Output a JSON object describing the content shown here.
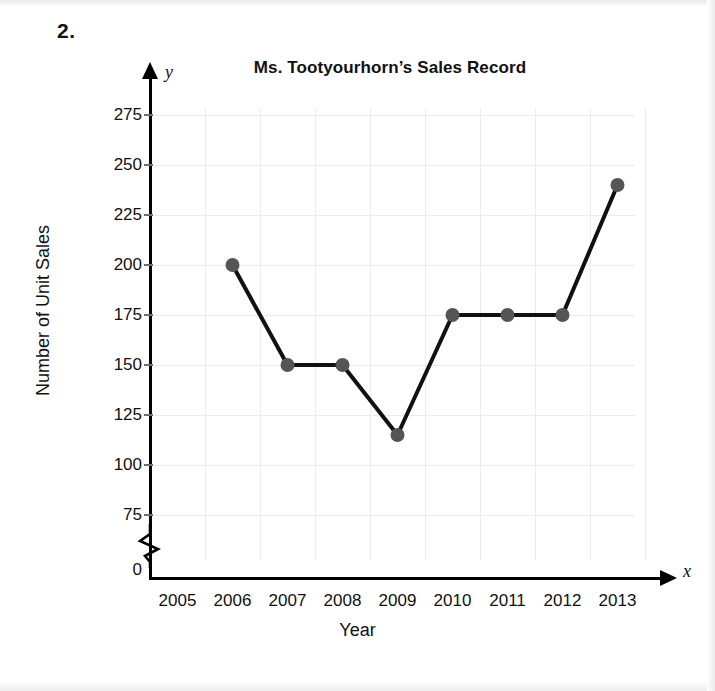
{
  "worksheet": {
    "problem_number": "2."
  },
  "chart_data": {
    "type": "line",
    "title": "Ms. Tootyourhorn’s Sales Record",
    "xlabel": "Year",
    "ylabel": "Number of Unit Sales",
    "x_axis_letter": "x",
    "y_axis_letter": "y",
    "categories": [
      "2005",
      "2006",
      "2007",
      "2008",
      "2009",
      "2010",
      "2011",
      "2012",
      "2013"
    ],
    "x_tick_labels": [
      "2005",
      "2006",
      "2007",
      "2008",
      "2009",
      "2010",
      "2011",
      "2012",
      "2013"
    ],
    "y_tick_labels": [
      "275",
      "250",
      "225",
      "200",
      "175",
      "150",
      "125",
      "100",
      "75",
      "0"
    ],
    "y_tick_values": [
      275,
      250,
      225,
      200,
      175,
      150,
      125,
      100,
      75,
      0
    ],
    "ylim": [
      75,
      275
    ],
    "y_axis_break": true,
    "y_axis_break_between": [
      0,
      75
    ],
    "grid": true,
    "legend": "none",
    "series": [
      {
        "name": "Unit Sales",
        "points": [
          {
            "x": "2006",
            "y": 200
          },
          {
            "x": "2007",
            "y": 150
          },
          {
            "x": "2008",
            "y": 150
          },
          {
            "x": "2009",
            "y": 115
          },
          {
            "x": "2010",
            "y": 175
          },
          {
            "x": "2011",
            "y": 175
          },
          {
            "x": "2012",
            "y": 175
          },
          {
            "x": "2013",
            "y": 240
          }
        ],
        "line_color": "#111111",
        "marker_color": "#555555"
      }
    ],
    "colors": {
      "grid": "#ececec",
      "axis": "#000000",
      "line": "#111111",
      "marker": "#555555",
      "background": "#ffffff"
    }
  }
}
